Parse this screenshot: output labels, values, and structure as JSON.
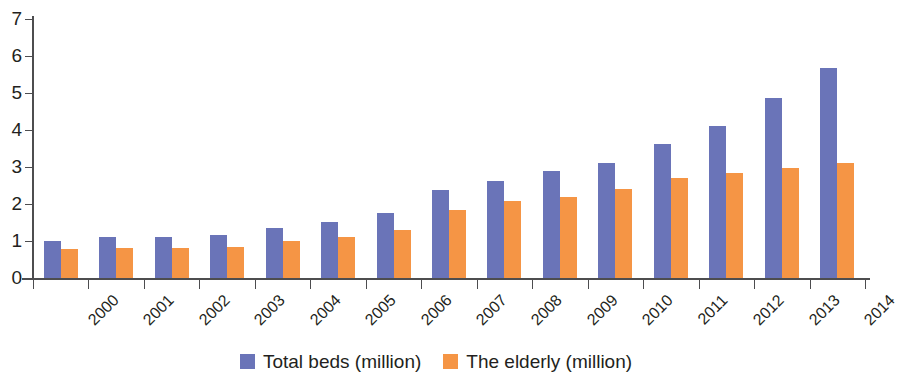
{
  "chart_data": {
    "type": "bar",
    "title": "",
    "subtitle": "",
    "xlabel": "",
    "ylabel": "",
    "ylim": [
      0,
      7
    ],
    "yticks": [
      0,
      1,
      2,
      3,
      4,
      5,
      6,
      7
    ],
    "grid": false,
    "legend_position": "bottom",
    "categories": [
      "2000",
      "2001",
      "2002",
      "2003",
      "2004",
      "2005",
      "2006",
      "2007",
      "2008",
      "2009",
      "2010",
      "2011",
      "2012",
      "2013",
      "2014"
    ],
    "series": [
      {
        "name": "Total beds (million)",
        "color": "#6a74b8",
        "values": [
          1.0,
          1.12,
          1.1,
          1.16,
          1.34,
          1.52,
          1.77,
          2.38,
          2.62,
          2.88,
          3.1,
          3.62,
          4.1,
          4.87,
          5.68
        ]
      },
      {
        "name": "The elderly (million)",
        "color": "#f59545",
        "values": [
          0.78,
          0.8,
          0.82,
          0.85,
          1.0,
          1.1,
          1.3,
          1.85,
          2.07,
          2.2,
          2.4,
          2.7,
          2.85,
          2.98,
          3.1
        ]
      }
    ]
  },
  "axis": {
    "y_tick_labels": [
      "7",
      "6",
      "5",
      "4",
      "3",
      "2",
      "1",
      "0"
    ]
  },
  "legend": {
    "items": [
      {
        "label": "Total beds (million)",
        "color": "#6a74b8"
      },
      {
        "label": "The elderly (million)",
        "color": "#f59545"
      }
    ]
  }
}
